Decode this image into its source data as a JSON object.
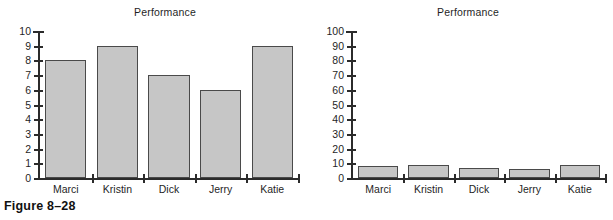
{
  "figure": {
    "caption": "Figure 8–28"
  },
  "charts": [
    {
      "id": "left",
      "title": "Performance",
      "y_tick_labels": [
        "0",
        "1",
        "2",
        "3",
        "4",
        "5",
        "6",
        "7",
        "8",
        "9",
        "10"
      ],
      "category_labels": [
        "Marci",
        "Kristin",
        "Dick",
        "Jerry",
        "Katie"
      ]
    },
    {
      "id": "right",
      "title": "Performance",
      "y_tick_labels": [
        "0",
        "10",
        "20",
        "30",
        "40",
        "50",
        "60",
        "70",
        "80",
        "90",
        "100"
      ],
      "category_labels": [
        "Marci",
        "Kristin",
        "Dick",
        "Jerry",
        "Katie"
      ]
    }
  ],
  "colors": {
    "bar_fill": "#c6c6c6",
    "bar_border": "#4a4a4a",
    "axis": "#2b2b2b",
    "text": "#1f1f1f",
    "background": "#ffffff"
  },
  "chart_data": [
    {
      "type": "bar",
      "title": "Performance",
      "categories": [
        "Marci",
        "Kristin",
        "Dick",
        "Jerry",
        "Katie"
      ],
      "values": [
        8,
        9,
        7,
        6,
        9
      ],
      "xlabel": "",
      "ylabel": "",
      "ylim": [
        0,
        10
      ],
      "ytick_step": 1,
      "yticks": [
        0,
        1,
        2,
        3,
        4,
        5,
        6,
        7,
        8,
        9,
        10
      ],
      "grid": false,
      "legend": false
    },
    {
      "type": "bar",
      "title": "Performance",
      "categories": [
        "Marci",
        "Kristin",
        "Dick",
        "Jerry",
        "Katie"
      ],
      "values": [
        8,
        9,
        7,
        6,
        9
      ],
      "xlabel": "",
      "ylabel": "",
      "ylim": [
        0,
        100
      ],
      "ytick_step": 10,
      "yticks": [
        0,
        10,
        20,
        30,
        40,
        50,
        60,
        70,
        80,
        90,
        100
      ],
      "grid": false,
      "legend": false
    }
  ]
}
